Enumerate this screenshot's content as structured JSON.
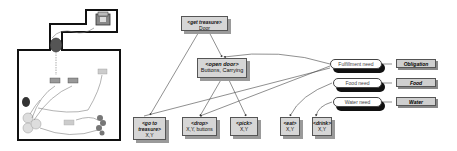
{
  "scene": {
    "description": "Floor plan map with rooms, objects and movement paths",
    "objects": [
      "treasure-chest",
      "door",
      "button-1",
      "button-2",
      "item",
      "barrel",
      "agents",
      "plant",
      "food"
    ]
  },
  "nodes": {
    "get_treasure": {
      "title": "<get treasure>",
      "param": "Door"
    },
    "open_door": {
      "title": "<open door>",
      "param": "Buttons, Carrying"
    },
    "go_to_treasure": {
      "title": "<go to treasure>",
      "param": "X,Y"
    },
    "drop": {
      "title": "<drop>",
      "param": "X,Y, buttons"
    },
    "pick": {
      "title": "<pick>",
      "param": "X,Y"
    },
    "eat": {
      "title": "<eat>",
      "param": "X,Y"
    },
    "drink": {
      "title": "<drink>",
      "param": "X,Y"
    }
  },
  "needs": [
    {
      "label": "Fulfillment need",
      "resource": "Obligation"
    },
    {
      "label": "Food need",
      "resource": "Food"
    },
    {
      "label": "Water need",
      "resource": "Water"
    }
  ]
}
